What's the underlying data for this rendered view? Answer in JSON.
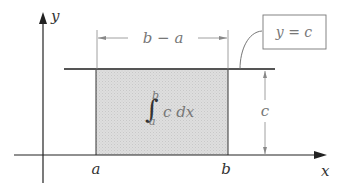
{
  "diagram": {
    "type": "area-under-constant-function",
    "axes": {
      "x_label": "x",
      "y_label": "y"
    },
    "ticks": {
      "a_label": "a",
      "b_label": "b"
    },
    "width_annotation": {
      "text": "b − a"
    },
    "height_annotation": {
      "text": "c"
    },
    "function_callout": {
      "text": "y = c"
    },
    "shaded_region": {
      "integral_upper": "b",
      "integral_lower": "a",
      "integrand": "c dx",
      "fill_color": "#dcdcdc"
    },
    "colors": {
      "line": "#555555",
      "axis": "#222222",
      "guide": "#888888"
    }
  }
}
